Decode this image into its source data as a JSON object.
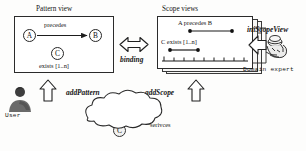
{
  "figure": {
    "width": 306,
    "height": 151,
    "background": "#fdfdfc",
    "ink": "#1a1a1a"
  },
  "pattern_view": {
    "title": "Pattern view",
    "nodes": [
      {
        "id": "A",
        "label": "A"
      },
      {
        "id": "B",
        "label": "B"
      },
      {
        "id": "C",
        "label": "C"
      }
    ],
    "relation_label": "precedes",
    "cardinality_label": "exists [1..n]"
  },
  "binding": {
    "label": "binding",
    "arrow": "double-headed-horizontal-arrow"
  },
  "scope_views": {
    "title": "Scope views",
    "stack_count": 3,
    "timelines": [
      {
        "label": "A precedes B",
        "start_marker": "A",
        "end_marker": "B"
      },
      {
        "label": "C exists [1..n]",
        "start_marker": "C",
        "end_marker": "C"
      }
    ],
    "axis": {
      "ticks": 9
    }
  },
  "domain_expert": {
    "operation_label": "iniScopeView",
    "actor_label": "Domain expert",
    "arrow": "left-block-arrow"
  },
  "user": {
    "actor_label": "User",
    "operation_label": "addPattern",
    "arrow": "up-block-arrow"
  },
  "scope_action": {
    "operation_label": "addScope",
    "arrow": "up-block-arrow"
  },
  "services_cloud": {
    "label": "serivces",
    "nodes": [
      {
        "id": "A",
        "label": "A"
      },
      {
        "id": "B",
        "label": "B"
      },
      {
        "id": "C",
        "label": "C"
      }
    ]
  }
}
